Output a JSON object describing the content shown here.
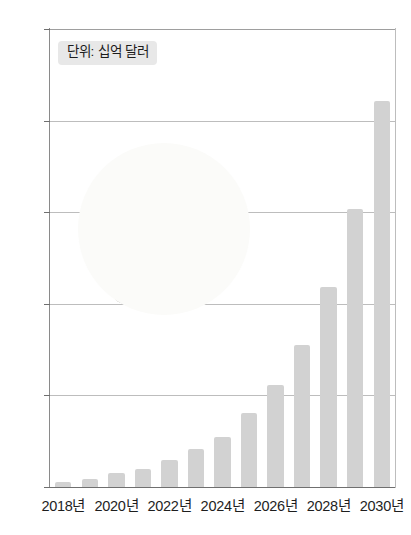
{
  "chart_data": {
    "type": "bar",
    "title": "",
    "subtitle": "",
    "unit_label": "단위: 십억 달러",
    "xlabel": "",
    "ylabel": "",
    "ylim": [
      0,
      40
    ],
    "yticks": [
      0,
      8,
      16,
      24,
      32,
      40
    ],
    "grid": true,
    "legend": null,
    "categories": [
      "2018년",
      "2019년",
      "2020년",
      "2021년",
      "2022년",
      "2023년",
      "2024년",
      "2025년",
      "2026년",
      "2027년",
      "2028년",
      "2029년",
      "2030년"
    ],
    "x_tick_labels": [
      "2018년",
      "2020년",
      "2022년",
      "2024년",
      "2026년",
      "2028년",
      "2030년"
    ],
    "values": [
      0.4,
      0.7,
      1.2,
      1.6,
      2.4,
      3.3,
      4.4,
      6.5,
      8.9,
      12.4,
      17.5,
      24.3,
      33.7
    ],
    "bar_color": "#d2d2d2",
    "gridline_color": "#bdbdbd",
    "axis_color": "#6f6f6f",
    "text_color": "#1e1e1e"
  },
  "illustration": {
    "name": "bread-loaf-illustration",
    "description": "sliced bread loaf with scattered grains on light circular background",
    "disc_color": "#fbfbf9"
  }
}
